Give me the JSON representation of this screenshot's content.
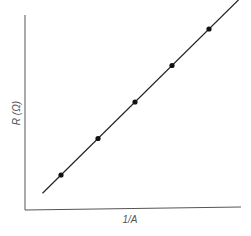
{
  "chart_data": {
    "type": "scatter",
    "title": "",
    "xlabel": "1/A",
    "ylabel": "R (Ω)",
    "grid": false,
    "legend": null,
    "ticks": false,
    "series": [
      {
        "name": "measurements",
        "marker": "filled-circle",
        "x": [
          1,
          2,
          3,
          4,
          5
        ],
        "y": [
          1,
          2,
          3,
          4,
          5
        ]
      },
      {
        "name": "best-fit line",
        "style": "solid-line",
        "x": [
          0.5,
          5.8
        ],
        "y": [
          0.5,
          5.8
        ]
      }
    ],
    "colors": {
      "axis": "#555555",
      "line": "#222222",
      "marker": "#111111"
    }
  }
}
